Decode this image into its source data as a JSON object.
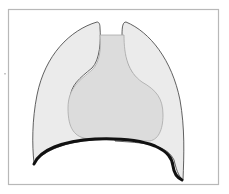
{
  "diagram": {
    "labels": [],
    "colors": {
      "background": "#ffffff",
      "frame": "#b8b8b8",
      "lung_fill": "#ebebeb",
      "lung_outline": "#3a3a3a",
      "mediastinum_fill": "#dcdcdc",
      "mediastinum_outline": "#a8a8a8",
      "diaphragm": "#111111"
    },
    "parts": [
      {
        "name": "left-lung",
        "label": ""
      },
      {
        "name": "right-lung",
        "label": ""
      },
      {
        "name": "mediastinum",
        "label": ""
      },
      {
        "name": "diaphragm",
        "label": ""
      }
    ]
  }
}
